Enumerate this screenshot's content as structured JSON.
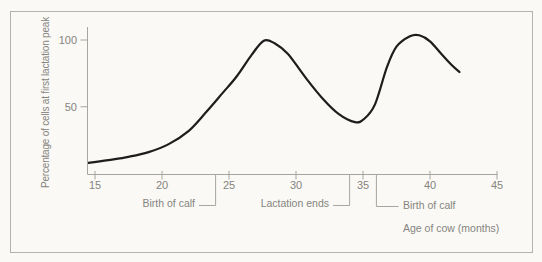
{
  "colors": {
    "background": "#faf9f5",
    "frame_border": "#b3b2ad",
    "axis": "#a6a5a0",
    "text": "#85847f",
    "curve": "#1d1d1d"
  },
  "chart_data": {
    "type": "line",
    "xlabel": "Age of cow (months)",
    "ylabel": "Percentage of cells at first lactation peak",
    "x_ticks": [
      15,
      20,
      25,
      30,
      35,
      40,
      45
    ],
    "y_ticks": [
      50,
      100
    ],
    "xlim": [
      14.5,
      45
    ],
    "ylim": [
      0,
      110
    ],
    "grid": false,
    "legend": "none",
    "series": [
      {
        "name": "percentage of cells at first lactation peak",
        "points": [
          [
            14.5,
            8
          ],
          [
            16,
            10
          ],
          [
            17.5,
            12.5
          ],
          [
            19,
            16
          ],
          [
            20.5,
            22
          ],
          [
            22,
            32
          ],
          [
            23.3,
            46
          ],
          [
            24.5,
            60
          ],
          [
            25.6,
            73
          ],
          [
            26.7,
            89
          ],
          [
            27.6,
            99.5
          ],
          [
            28.4,
            97.5
          ],
          [
            29.4,
            89.5
          ],
          [
            30.7,
            72
          ],
          [
            32,
            56
          ],
          [
            33.2,
            44.5
          ],
          [
            34.4,
            38.5
          ],
          [
            35.1,
            41
          ],
          [
            35.9,
            52
          ],
          [
            36.8,
            80
          ],
          [
            37.5,
            95
          ],
          [
            38.5,
            102.8
          ],
          [
            39.2,
            103.5
          ],
          [
            40,
            99
          ],
          [
            40.9,
            89
          ],
          [
            41.6,
            81.5
          ],
          [
            42.2,
            76
          ]
        ]
      }
    ],
    "annotations": [
      {
        "label": "Birth of calf",
        "x": 24
      },
      {
        "label": "Lactation ends",
        "x": 34
      },
      {
        "label": "Birth of calf",
        "x": 36
      }
    ]
  }
}
